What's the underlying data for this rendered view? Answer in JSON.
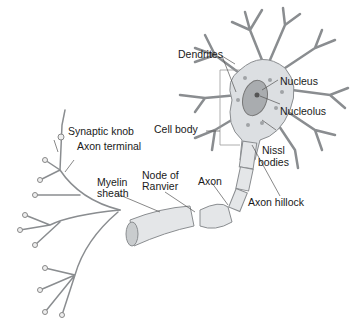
{
  "diagram": {
    "labels": {
      "dendrites": "Dendrites",
      "nucleus": "Nucleus",
      "nucleolus": "Nucleolus",
      "cell_body": "Cell body",
      "nissl_1": "Nissl",
      "nissl_2": "bodies",
      "synaptic_knob": "Synaptic knob",
      "axon_terminal": "Axon terminal",
      "node_1": "Node of",
      "node_2": "Ranvier",
      "myelin_1": "Myelin",
      "myelin_2": "sheath",
      "axon": "Axon",
      "axon_hillock": "Axon hillock"
    },
    "colors": {
      "cell_fill": "#d9dcdf",
      "stroke": "#8a8d90",
      "nucleus": "#a9acaf",
      "text": "#1a1a1a"
    }
  }
}
